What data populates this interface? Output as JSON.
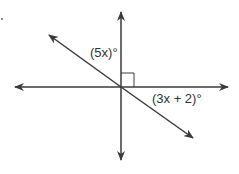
{
  "diagram": {
    "type": "intersecting-lines",
    "line_color": "#3a3a3a",
    "labels": {
      "upper_angle": "(5x)°",
      "lower_angle": "(3x + 2)°"
    },
    "right_angle_marker": true
  }
}
